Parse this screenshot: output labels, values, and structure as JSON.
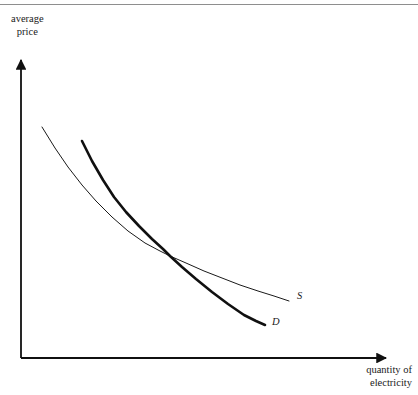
{
  "figure": {
    "width": 418,
    "height": 395,
    "background_color": "#ffffff",
    "ink_color": "#1a1a1a",
    "top_rule_color": "#8e8e8e"
  },
  "chart_data": {
    "type": "line",
    "title": "",
    "subtitle": "",
    "xlabel": "quantity of electricity",
    "ylabel": "average price",
    "xlabel_lines": [
      "quantity of",
      "electricity"
    ],
    "ylabel_lines": [
      "average",
      "price"
    ],
    "grid": false,
    "legend": "inline-end-of-curve",
    "axes": {
      "x_axis": {
        "from": [
          21,
          358
        ],
        "to": [
          392,
          358
        ],
        "arrow": true,
        "tick_labels": [],
        "range_labeled": false
      },
      "y_axis": {
        "from": [
          21,
          358
        ],
        "to": [
          21,
          55
        ],
        "arrow": true,
        "tick_labels": [],
        "range_labeled": false
      },
      "origin": [
        21,
        358
      ]
    },
    "series": [
      {
        "name": "S",
        "label": "S",
        "description": "supply curve, thin stroke, downward sloping convex",
        "stroke_width": 1,
        "color": "#1a1a1a",
        "label_position": [
          297,
          290
        ],
        "points": [
          [
            42,
            127
          ],
          [
            55,
            148
          ],
          [
            68,
            167
          ],
          [
            82,
            185
          ],
          [
            96,
            201
          ],
          [
            112,
            217
          ],
          [
            128,
            231
          ],
          [
            145,
            243
          ],
          [
            160,
            251
          ],
          [
            170,
            256
          ],
          [
            186,
            263
          ],
          [
            204,
            271
          ],
          [
            222,
            278
          ],
          [
            240,
            285
          ],
          [
            258,
            291
          ],
          [
            274,
            296
          ],
          [
            289,
            301
          ]
        ]
      },
      {
        "name": "D",
        "label": "D",
        "description": "demand curve, thick stroke, steeper downward sloping convex",
        "stroke_width": 2.6,
        "color": "#101010",
        "label_position": [
          272,
          316
        ],
        "points": [
          [
            82,
            141
          ],
          [
            92,
            161
          ],
          [
            103,
            180
          ],
          [
            114,
            197
          ],
          [
            126,
            212
          ],
          [
            139,
            226
          ],
          [
            152,
            239
          ],
          [
            163,
            249
          ],
          [
            170,
            256
          ],
          [
            182,
            267
          ],
          [
            196,
            279
          ],
          [
            212,
            292
          ],
          [
            228,
            304
          ],
          [
            244,
            315
          ],
          [
            256,
            321
          ],
          [
            265,
            325
          ]
        ]
      }
    ],
    "intersection_point": [
      170,
      256
    ],
    "annotations": []
  }
}
